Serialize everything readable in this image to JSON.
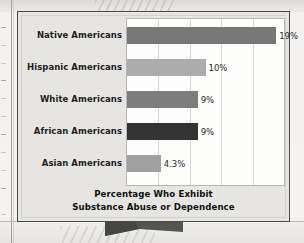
{
  "figure": {
    "caption_line1": "Percentage Who Exhibit",
    "caption_line2": "Substance Abuse or Dependence",
    "panel_bg": "#e6e5e2",
    "panel_border": "#4a4a49",
    "plot_bg": "#fdfdfc",
    "gridline_color": "#d6d5d2",
    "pointer_color": "#545452"
  },
  "chart_data": {
    "type": "bar",
    "orientation": "horizontal",
    "title": "Percentage Who Exhibit Substance Abuse or Dependence",
    "xlabel": "",
    "ylabel": "",
    "xlim": [
      0,
      20
    ],
    "grid": true,
    "gridlines": [
      4,
      8,
      12,
      16
    ],
    "legend": "none",
    "categories": [
      "Native Americans",
      "Hispanic Americans",
      "White Americans",
      "African Americans",
      "Asian Americans"
    ],
    "values": [
      19,
      10,
      9,
      9,
      4.3
    ],
    "value_labels": [
      "19%",
      "10%",
      "9%",
      "9%",
      "4.3%"
    ],
    "bar_colors": [
      "#787878",
      "#acacac",
      "#7d7d7d",
      "#333333",
      "#a0a0a0"
    ]
  }
}
